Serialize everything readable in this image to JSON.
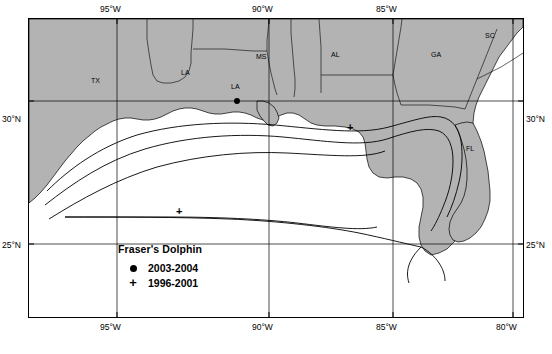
{
  "figure": {
    "land_color": "#b3b3b3",
    "water_color": "#ffffff",
    "line_color": "#000000"
  },
  "axes": {
    "top_ticks": [
      {
        "label": "95°W",
        "x": 116
      },
      {
        "label": "90°W",
        "x": 268
      },
      {
        "label": "85°W",
        "x": 392
      }
    ],
    "bottom_ticks": [
      {
        "label": "95°W",
        "x": 116
      },
      {
        "label": "90°W",
        "x": 268
      },
      {
        "label": "85°W",
        "x": 392
      },
      {
        "label": "80°W",
        "x": 512
      }
    ],
    "left_ticks": [
      {
        "label": "30°N",
        "y": 100
      },
      {
        "label": "25°N",
        "y": 243
      }
    ],
    "right_ticks": [
      {
        "label": "30°N",
        "y": 100
      },
      {
        "label": "25°N",
        "y": 243
      }
    ]
  },
  "legend": {
    "title": "Fraser's Dolphin",
    "entries": [
      {
        "symbol": "filled-circle",
        "label": "2003-2004"
      },
      {
        "symbol": "plus",
        "label": "1996-2001"
      }
    ]
  },
  "region_labels": [
    {
      "text": "TX",
      "x": 70,
      "y": 79
    },
    {
      "text": "LA",
      "x": 180,
      "y": 72
    },
    {
      "text": "LA",
      "x": 230,
      "y": 86
    },
    {
      "text": "MS",
      "x": 255,
      "y": 57
    },
    {
      "text": "AL",
      "x": 330,
      "y": 55
    },
    {
      "text": "GA",
      "x": 430,
      "y": 55
    },
    {
      "text": "SC",
      "x": 484,
      "y": 36
    },
    {
      "text": "FL",
      "x": 465,
      "y": 148
    }
  ],
  "data_points": {
    "sightings_2003_2004": [
      {
        "x": 235,
        "y": 101
      }
    ],
    "sightings_1996_2001": [
      {
        "x": 349,
        "y": 130
      },
      {
        "x": 177,
        "y": 214
      }
    ]
  }
}
